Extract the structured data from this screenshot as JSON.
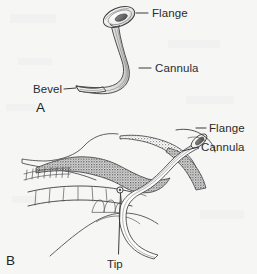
{
  "figure": {
    "background_color": "#f6f6f5",
    "ink_color": "#3c3c3c",
    "text_color": "#2b2b2b",
    "tissue_fill_color": "#9a9a9a",
    "panels": [
      {
        "letter": "A",
        "name": "isolated-device-view",
        "description": "Nasopharyngeal airway shown alone, curved tube with funnel flange at top and beveled tip at lower left",
        "labels": [
          {
            "text": "Flange",
            "name": "label-flange-a"
          },
          {
            "text": "Cannula",
            "name": "label-cannula-a"
          },
          {
            "text": "Bevel",
            "name": "label-bevel-a"
          }
        ]
      },
      {
        "letter": "B",
        "name": "sagittal-anatomy-view",
        "description": "Midsagittal section of head and neck with the nasopharyngeal airway inserted through the nostril",
        "labels": [
          {
            "text": "Flange",
            "name": "label-flange-b"
          },
          {
            "text": "Cannula",
            "name": "label-cannula-b"
          },
          {
            "text": "Tip",
            "name": "label-tip-b"
          }
        ]
      }
    ]
  },
  "labels": {
    "flange_a": "Flange",
    "cannula_a": "Cannula",
    "bevel_a": "Bevel",
    "panel_a": "A",
    "flange_b": "Flange",
    "cannula_b": "Cannula",
    "tip_b": "Tip",
    "panel_b": "B"
  }
}
